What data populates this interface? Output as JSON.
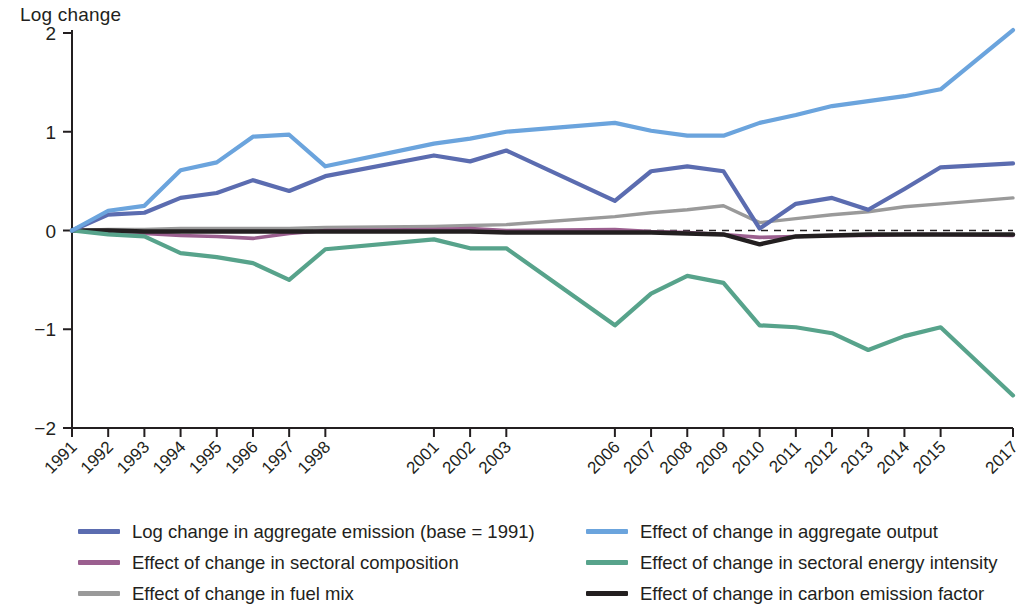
{
  "chart_data": {
    "type": "line",
    "title": "",
    "ylabel": "Log change",
    "xlabel": "",
    "ylim": [
      -2,
      2
    ],
    "yticks": [
      -2,
      -1,
      0,
      1,
      2
    ],
    "ytick_labels": [
      "−2",
      "−1",
      "0",
      "1",
      "2"
    ],
    "grid": false,
    "zero_reference_line": true,
    "legend_position": "bottom",
    "categories": [
      "1991",
      "1992",
      "1993",
      "1994",
      "1995",
      "1996",
      "1997",
      "1998",
      "2001",
      "2002",
      "2003",
      "2006",
      "2007",
      "2008",
      "2009",
      "2010",
      "2011",
      "2012",
      "2013",
      "2014",
      "2015",
      "2017"
    ],
    "series": [
      {
        "name": "Log change in aggregate emission (base = 1991)",
        "color": "#5b6cb0",
        "values": [
          0.0,
          0.16,
          0.18,
          0.33,
          0.38,
          0.51,
          0.4,
          0.55,
          0.76,
          0.7,
          0.81,
          0.3,
          0.6,
          0.65,
          0.6,
          0.02,
          0.27,
          0.33,
          0.21,
          0.42,
          0.64,
          0.68
        ]
      },
      {
        "name": "Effect of change in aggregate output",
        "color": "#6ba4dd",
        "values": [
          0.0,
          0.2,
          0.25,
          0.61,
          0.69,
          0.95,
          0.97,
          0.65,
          0.88,
          0.93,
          1.0,
          1.09,
          1.01,
          0.96,
          0.96,
          1.09,
          1.17,
          1.26,
          1.31,
          1.36,
          1.43,
          2.03
        ]
      },
      {
        "name": "Effect of change in sectoral composition",
        "color": "#9b5f8f",
        "values": [
          0.0,
          -0.02,
          -0.03,
          -0.05,
          -0.06,
          -0.08,
          -0.03,
          0.0,
          0.01,
          0.02,
          0.0,
          0.01,
          -0.01,
          -0.02,
          -0.04,
          -0.07,
          -0.06,
          -0.05,
          -0.05,
          -0.04,
          -0.04,
          -0.05
        ]
      },
      {
        "name": "Effect of change in sectoral energy intensity",
        "color": "#57a38b",
        "values": [
          0.0,
          -0.04,
          -0.06,
          -0.23,
          -0.27,
          -0.33,
          -0.5,
          -0.19,
          -0.09,
          -0.18,
          -0.18,
          -0.96,
          -0.64,
          -0.46,
          -0.53,
          -0.96,
          -0.98,
          -1.04,
          -1.21,
          -1.07,
          -0.98,
          -1.67
        ]
      },
      {
        "name": "Effect of change in fuel mix",
        "color": "#9a9a9a",
        "values": [
          0.0,
          0.01,
          0.01,
          0.02,
          0.02,
          0.02,
          0.02,
          0.03,
          0.04,
          0.05,
          0.06,
          0.14,
          0.18,
          0.21,
          0.25,
          0.08,
          0.12,
          0.16,
          0.19,
          0.24,
          0.27,
          0.33
        ]
      },
      {
        "name": "Effect of change in carbon emission factor",
        "color": "#231f20",
        "values": [
          0.0,
          0.0,
          -0.01,
          -0.01,
          -0.01,
          -0.01,
          -0.01,
          -0.01,
          -0.01,
          -0.01,
          -0.02,
          -0.02,
          -0.02,
          -0.03,
          -0.04,
          -0.14,
          -0.06,
          -0.05,
          -0.04,
          -0.04,
          -0.04,
          -0.04
        ]
      }
    ]
  },
  "legend": {
    "items": [
      {
        "label": "Log change in aggregate emission (base = 1991)",
        "color": "#5b6cb0"
      },
      {
        "label": "Effect of change in aggregate output",
        "color": "#6ba4dd"
      },
      {
        "label": "Effect of change in sectoral composition",
        "color": "#9b5f8f"
      },
      {
        "label": "Effect of change in sectoral energy intensity",
        "color": "#57a38b"
      },
      {
        "label": "Effect of change in fuel mix",
        "color": "#9a9a9a"
      },
      {
        "label": "Effect of change in carbon emission factor",
        "color": "#231f20"
      }
    ]
  }
}
